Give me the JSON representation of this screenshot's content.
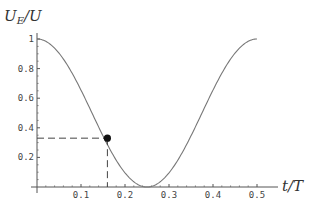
{
  "chart_data": {
    "type": "line",
    "title": "",
    "xlabel": "t/T",
    "ylabel": "U_E/U",
    "xlim": [
      0,
      0.5
    ],
    "ylim": [
      0,
      1
    ],
    "x_ticks": [
      "0.1",
      "0.2",
      "0.3",
      "0.4",
      "0.5"
    ],
    "y_ticks": [
      "0.2",
      "0.4",
      "0.6",
      "0.8",
      "1"
    ],
    "grid": false,
    "series": [
      {
        "name": "U_E/U = cos^2(2πt/T)",
        "x": [
          0,
          0.05,
          0.1,
          0.15,
          0.2,
          0.25,
          0.3,
          0.35,
          0.4,
          0.45,
          0.5
        ],
        "values": [
          1,
          0.905,
          0.655,
          0.345,
          0.095,
          0,
          0.095,
          0.345,
          0.655,
          0.905,
          1
        ]
      }
    ],
    "annotations": [
      {
        "type": "point",
        "x": 0.16,
        "y": 0.33,
        "style": "filled-circle"
      },
      {
        "type": "dashed-guides",
        "x": 0.16,
        "y": 0.33
      }
    ]
  },
  "labels": {
    "ylabel_main": "U",
    "ylabel_sub": "E",
    "ylabel_rest": "/U",
    "xlabel": "t/T"
  }
}
